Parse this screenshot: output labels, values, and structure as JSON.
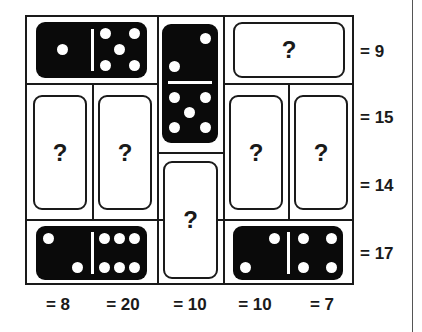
{
  "puzzle": {
    "unknown_symbol": "?",
    "row_sums": [
      "= 9",
      "= 15",
      "= 14",
      "= 17"
    ],
    "column_sums": [
      "= 8",
      "= 20",
      "= 10",
      "= 10",
      "= 7"
    ],
    "known_dominoes": [
      {
        "position": "top-left",
        "orientation": "horizontal",
        "halves": [
          1,
          5
        ]
      },
      {
        "position": "top-center",
        "orientation": "vertical",
        "halves": [
          2,
          5
        ]
      },
      {
        "position": "bottom-left",
        "orientation": "horizontal",
        "halves": [
          2,
          6
        ]
      },
      {
        "position": "bottom-right",
        "orientation": "horizontal",
        "halves": [
          2,
          4
        ]
      }
    ],
    "unknown_dominoes": [
      {
        "position": "top-right",
        "orientation": "horizontal"
      },
      {
        "position": "middle-left-1",
        "orientation": "vertical"
      },
      {
        "position": "middle-left-2",
        "orientation": "vertical"
      },
      {
        "position": "lower-center",
        "orientation": "vertical"
      },
      {
        "position": "middle-right-1",
        "orientation": "vertical"
      },
      {
        "position": "middle-right-2",
        "orientation": "vertical"
      }
    ]
  }
}
